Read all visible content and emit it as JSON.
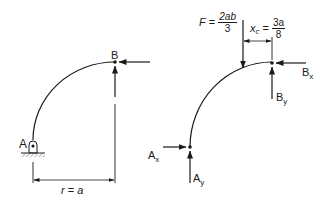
{
  "left_figure": {
    "point_a_label": "A",
    "point_b_label": "B",
    "dimension": {
      "var": "r",
      "eq": " = ",
      "val": "a"
    }
  },
  "right_figure": {
    "force": {
      "var": "F",
      "eq": " = ",
      "numerator": "2ab",
      "denominator": "3"
    },
    "centroid": {
      "var": "x",
      "sub": "c",
      "eq": " = ",
      "numerator": "3a",
      "denominator": "8"
    },
    "reactions": {
      "ax": {
        "main": "A",
        "sub": "x"
      },
      "ay": {
        "main": "A",
        "sub": "y"
      },
      "bx": {
        "main": "B",
        "sub": "x"
      },
      "by": {
        "main": "B",
        "sub": "y"
      }
    }
  },
  "colors": {
    "ink": "#1a1a1a",
    "background": "#ffffff"
  }
}
